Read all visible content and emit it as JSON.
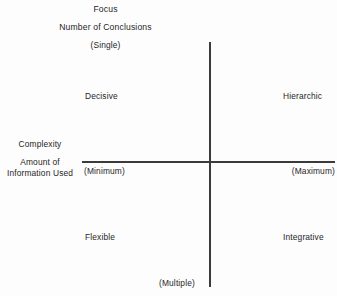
{
  "figure": {
    "background_color": "#fdfdfd",
    "line_color": "#3b3b3b",
    "text_color": "#262626"
  },
  "axes": {
    "vertical": {
      "title": "Focus",
      "subtitle": "Number of Conclusions",
      "top_endpoint": "(Single)",
      "bottom_endpoint": "(Multiple)"
    },
    "horizontal": {
      "title": "Complexity",
      "subtitle_line1": "Amount of",
      "subtitle_line2": "Information Used",
      "left_endpoint": "(Minimum)",
      "right_endpoint": "(Maximum)"
    }
  },
  "quadrants": {
    "top_left": "Decisive",
    "top_right": "Hierarchic",
    "bottom_left": "Flexible",
    "bottom_right": "Integrative"
  },
  "chart_data": {
    "type": "scatter",
    "title": "Focus",
    "subtitle": "Number of Conclusions",
    "xlabel": "Complexity / Amount of Information Used",
    "ylabel": "Focus / Number of Conclusions",
    "grid": false,
    "legend": null,
    "xlim": [
      "(Minimum)",
      "(Maximum)"
    ],
    "ylim": [
      "(Multiple)",
      "(Single)"
    ],
    "x_tick_labels": [
      "(Minimum)",
      "(Maximum)"
    ],
    "y_tick_labels": [
      "(Single)",
      "(Multiple)"
    ],
    "annotations": [
      {
        "label": "Decisive",
        "quadrant": "top-left",
        "x": "Minimum",
        "y": "Single"
      },
      {
        "label": "Hierarchic",
        "quadrant": "top-right",
        "x": "Maximum",
        "y": "Single"
      },
      {
        "label": "Flexible",
        "quadrant": "bottom-left",
        "x": "Minimum",
        "y": "Multiple"
      },
      {
        "label": "Integrative",
        "quadrant": "bottom-right",
        "x": "Maximum",
        "y": "Multiple"
      }
    ]
  }
}
